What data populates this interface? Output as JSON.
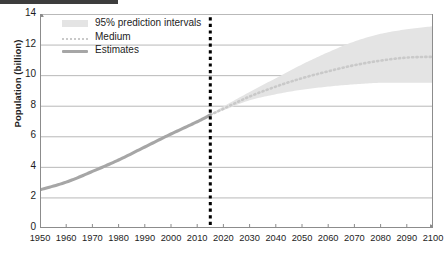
{
  "chart_data": {
    "type": "line",
    "title": "",
    "xlabel": "",
    "ylabel": "Population (billion)",
    "xlim": [
      1950,
      2100
    ],
    "ylim": [
      0,
      14
    ],
    "grid": true,
    "legend_position": "top-left",
    "xticks": [
      1950,
      1960,
      1970,
      1980,
      1990,
      2000,
      2010,
      2020,
      2030,
      2040,
      2050,
      2060,
      2070,
      2080,
      2090,
      2100
    ],
    "yticks": [
      0,
      2,
      4,
      6,
      8,
      10,
      12,
      14
    ],
    "annotations": [
      {
        "name": "projection-divider",
        "type": "vline",
        "x": 2015,
        "style": "dotted",
        "color": "#000000"
      }
    ],
    "series": [
      {
        "name": "Estimates",
        "style": "solid",
        "color": "#a6a6a6",
        "x": [
          1950,
          1960,
          1970,
          1980,
          1990,
          2000,
          2010,
          2015
        ],
        "values": [
          2.5,
          3.0,
          3.7,
          4.45,
          5.3,
          6.15,
          6.95,
          7.4
        ]
      },
      {
        "name": "Medium",
        "style": "dotted",
        "color": "#c9c9c9",
        "x": [
          2015,
          2020,
          2030,
          2040,
          2050,
          2060,
          2070,
          2080,
          2090,
          2100
        ],
        "values": [
          7.4,
          7.8,
          8.6,
          9.25,
          9.8,
          10.25,
          10.65,
          10.95,
          11.15,
          11.2
        ]
      },
      {
        "name": "95% prediction intervals",
        "style": "band",
        "color": "#e4e4e4",
        "x": [
          2015,
          2020,
          2030,
          2040,
          2050,
          2060,
          2070,
          2080,
          2090,
          2100
        ],
        "upper": [
          7.45,
          7.95,
          8.9,
          9.8,
          10.7,
          11.5,
          12.2,
          12.7,
          13.0,
          13.2
        ],
        "lower": [
          7.35,
          7.7,
          8.35,
          8.75,
          9.05,
          9.25,
          9.4,
          9.5,
          9.5,
          9.5
        ]
      }
    ]
  },
  "legend": {
    "items": [
      {
        "label": "95% prediction intervals",
        "swatch": "band"
      },
      {
        "label": "Medium",
        "swatch": "dotted"
      },
      {
        "label": "Estimates",
        "swatch": "solid"
      }
    ]
  }
}
